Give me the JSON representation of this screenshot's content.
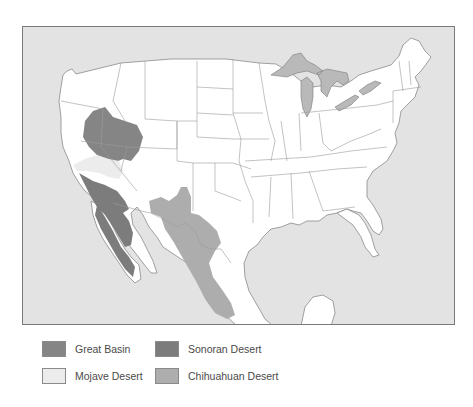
{
  "map": {
    "title": "North American Deserts",
    "colors": {
      "ocean": "#e3e3e3",
      "land": "#ffffff",
      "state_border": "#9a9a9a",
      "coast": "#8a8a8a",
      "great_lakes": "#b9b9b9",
      "great_basin": "#858585",
      "mojave": "#ececec",
      "sonoran": "#7c7c7c",
      "chihuahuan": "#adadad"
    }
  },
  "legend": {
    "items": [
      {
        "id": "great-basin",
        "label": "Great Basin",
        "color": "#858585"
      },
      {
        "id": "sonoran",
        "label": "Sonoran Desert",
        "color": "#7c7c7c"
      },
      {
        "id": "mojave",
        "label": "Mojave Desert",
        "color": "#ececec"
      },
      {
        "id": "chihuahuan",
        "label": "Chihuahuan Desert",
        "color": "#adadad"
      }
    ]
  }
}
